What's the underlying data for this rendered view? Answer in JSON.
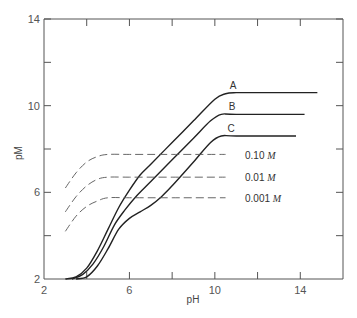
{
  "chart_data": {
    "type": "line",
    "title": "",
    "xlabel": "pH",
    "ylabel": "pM",
    "xlim": [
      2,
      16
    ],
    "ylim": [
      2,
      14
    ],
    "x_ticks": [
      2,
      6,
      10,
      14
    ],
    "x_tick_labels": [
      "2",
      "6",
      "10",
      "14"
    ],
    "x_minor_ticks": [
      4,
      8,
      12
    ],
    "y_ticks": [
      2,
      6,
      10,
      14
    ],
    "y_tick_labels": [
      "2",
      "6",
      "10",
      "14"
    ],
    "y_minor_ticks": [
      4,
      8,
      12
    ],
    "grid": false,
    "series": [
      {
        "name": "A",
        "style": "solid",
        "x": [
          3.0,
          3.5,
          4.0,
          4.5,
          5.0,
          5.5,
          6.0,
          6.5,
          7.0,
          8.0,
          9.0,
          10.0,
          10.5,
          11.0,
          12.0,
          14.8
        ],
        "y": [
          2.0,
          2.1,
          2.5,
          3.3,
          4.3,
          5.3,
          6.1,
          6.8,
          7.3,
          8.3,
          9.3,
          10.3,
          10.55,
          10.6,
          10.6,
          10.6
        ]
      },
      {
        "name": "B",
        "style": "solid",
        "x": [
          3.3,
          3.8,
          4.3,
          4.8,
          5.3,
          5.8,
          6.3,
          7.0,
          8.0,
          9.0,
          9.8,
          10.3,
          11.0,
          14.2
        ],
        "y": [
          2.0,
          2.2,
          2.7,
          3.5,
          4.5,
          5.2,
          5.8,
          6.5,
          7.5,
          8.5,
          9.3,
          9.6,
          9.6,
          9.6
        ]
      },
      {
        "name": "C",
        "style": "solid",
        "x": [
          3.5,
          4.0,
          4.5,
          5.0,
          5.5,
          6.0,
          6.5,
          7.0,
          7.5,
          8.0,
          9.0,
          9.8,
          10.3,
          11.0,
          13.8
        ],
        "y": [
          2.0,
          2.1,
          2.6,
          3.4,
          4.3,
          4.8,
          5.1,
          5.4,
          5.8,
          6.3,
          7.4,
          8.3,
          8.6,
          8.6,
          8.6
        ]
      },
      {
        "name": "0.10 M",
        "style": "dashed",
        "x": [
          3.0,
          3.5,
          4.0,
          4.5,
          5.0,
          6.0,
          8.0,
          10.5
        ],
        "y": [
          6.2,
          6.9,
          7.4,
          7.65,
          7.75,
          7.75,
          7.75,
          7.75
        ]
      },
      {
        "name": "0.01 M",
        "style": "dashed",
        "x": [
          3.0,
          3.5,
          4.0,
          4.5,
          5.0,
          6.0,
          8.0,
          10.5
        ],
        "y": [
          5.1,
          5.8,
          6.3,
          6.6,
          6.7,
          6.7,
          6.7,
          6.7
        ]
      },
      {
        "name": "0.001 M",
        "style": "dashed",
        "x": [
          3.0,
          3.5,
          4.0,
          4.5,
          5.0,
          6.0,
          8.0,
          10.5
        ],
        "y": [
          4.2,
          4.9,
          5.35,
          5.6,
          5.75,
          5.75,
          5.75,
          5.75
        ]
      }
    ],
    "annotations": [
      {
        "text": "A",
        "x": 10.8,
        "y": 10.9
      },
      {
        "text": "B",
        "x": 10.7,
        "y": 9.9
      },
      {
        "text": "C",
        "x": 10.6,
        "y": 8.9
      },
      {
        "text": "0.10 M",
        "x": 11.0,
        "y": 7.75
      },
      {
        "text": "0.01 M",
        "x": 11.0,
        "y": 6.7
      },
      {
        "text": "0.001 M",
        "x": 11.0,
        "y": 5.75
      }
    ]
  },
  "labels": {
    "xlabel": "pH",
    "ylabel": "pM",
    "x_ticks": [
      "2",
      "6",
      "10",
      "14"
    ],
    "y_ticks": [
      "2",
      "6",
      "10",
      "14"
    ],
    "curve_a": "A",
    "curve_b": "B",
    "curve_c": "C",
    "conc_010": "0.10",
    "conc_001": "0.01",
    "conc_0001": "0.001",
    "unit": "M"
  },
  "colors": {
    "line": "#222222",
    "axis": "#555555",
    "dashed": "#555555"
  }
}
